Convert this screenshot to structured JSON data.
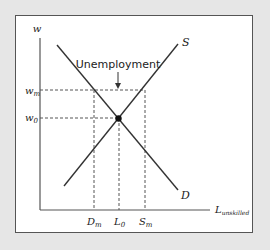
{
  "diagram": {
    "y_axis_label": "w",
    "x_axis_label_main": "L",
    "x_axis_label_sub": "unskilled",
    "curves": [
      {
        "name": "S",
        "label": "S"
      },
      {
        "name": "D",
        "label": "D"
      }
    ],
    "y_ticks": [
      {
        "main": "w",
        "sub": "m"
      },
      {
        "main": "w",
        "sub": "0"
      }
    ],
    "x_ticks": [
      {
        "main": "D",
        "sub": "m"
      },
      {
        "main": "L",
        "sub": "0"
      },
      {
        "main": "S",
        "sub": "m"
      }
    ],
    "annotation": "Unemployment"
  }
}
